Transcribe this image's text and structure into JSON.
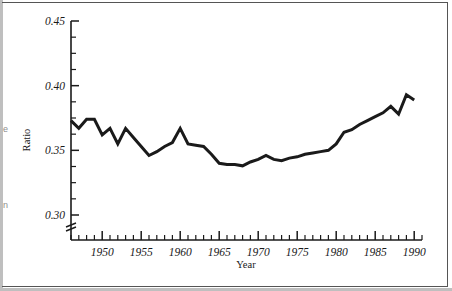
{
  "figure": {
    "margin_letters": [
      "e",
      "n"
    ],
    "background_color": "#ffffff",
    "frame_color": "#555555"
  },
  "chart_data": {
    "type": "line",
    "title": "",
    "subtitle": "",
    "xlabel": "Year",
    "ylabel": "Ratio",
    "xlim": [
      1946,
      1991
    ],
    "ylim": [
      0.3,
      0.45
    ],
    "y_axis_break": true,
    "grid": false,
    "legend": null,
    "line_color": "#1a1a1a",
    "line_width": 3,
    "y_ticks": [
      0.3,
      0.35,
      0.4,
      0.45
    ],
    "y_tick_labels": [
      "0.30",
      "0.35",
      "0.40",
      "0.45"
    ],
    "y_minor_tick_interval": 0.0125,
    "x_ticks": [
      1950,
      1955,
      1960,
      1965,
      1970,
      1975,
      1980,
      1985,
      1990
    ],
    "x_tick_labels": [
      "1950",
      "1955",
      "1960",
      "1965",
      "1970",
      "1975",
      "1980",
      "1985",
      "1990"
    ],
    "x_minor_tick_interval": 1,
    "series": [
      {
        "name": "Ratio",
        "x": [
          1946,
          1947,
          1948,
          1949,
          1950,
          1951,
          1952,
          1953,
          1954,
          1955,
          1956,
          1957,
          1958,
          1959,
          1960,
          1961,
          1962,
          1963,
          1964,
          1965,
          1966,
          1967,
          1968,
          1969,
          1970,
          1971,
          1972,
          1973,
          1974,
          1975,
          1976,
          1977,
          1978,
          1979,
          1980,
          1981,
          1982,
          1983,
          1984,
          1985,
          1986,
          1987,
          1988,
          1989,
          1990
        ],
        "values": [
          0.373,
          0.367,
          0.374,
          0.374,
          0.362,
          0.367,
          0.355,
          0.367,
          0.36,
          0.353,
          0.346,
          0.349,
          0.353,
          0.356,
          0.367,
          0.355,
          0.354,
          0.353,
          0.347,
          0.34,
          0.339,
          0.339,
          0.338,
          0.341,
          0.343,
          0.346,
          0.343,
          0.342,
          0.344,
          0.345,
          0.347,
          0.348,
          0.349,
          0.35,
          0.355,
          0.364,
          0.366,
          0.37,
          0.373,
          0.376,
          0.379,
          0.384,
          0.378,
          0.393,
          0.389
        ]
      }
    ]
  }
}
